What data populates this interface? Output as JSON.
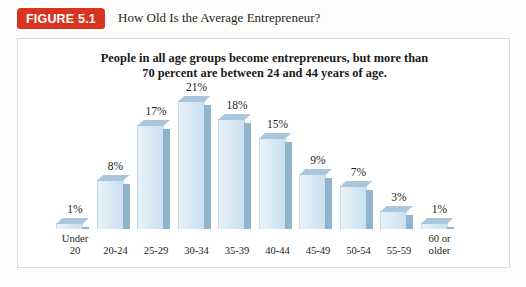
{
  "header": {
    "badge_label": "FIGURE 5.1",
    "title": "How Old Is the Average Entrepreneur?",
    "badge_color": "#d8341f"
  },
  "chart_data": {
    "type": "bar",
    "title": "How Old Is the Average Entrepreneur?",
    "subtitle_line1": "People in all age groups become entrepreneurs, but more than",
    "subtitle_line2": "70 percent are between 24 and 44 years of age.",
    "xlabel": "",
    "ylabel": "",
    "ylim": [
      0,
      21
    ],
    "grid": false,
    "legend": "none",
    "value_suffix": "%",
    "bar_face_color": "#d6e8f3",
    "bar_side_color": "#8fb4cc",
    "bar_top_color": "#a9c6da",
    "categories": [
      "Under 20",
      "20-24",
      "25-29",
      "30-34",
      "35-39",
      "40-44",
      "45-49",
      "50-54",
      "55-59",
      "60 or older"
    ],
    "category_lines": [
      [
        "Under",
        "20"
      ],
      [
        "20-24",
        ""
      ],
      [
        "25-29",
        ""
      ],
      [
        "30-34",
        ""
      ],
      [
        "35-39",
        ""
      ],
      [
        "40-44",
        ""
      ],
      [
        "45-49",
        ""
      ],
      [
        "50-54",
        ""
      ],
      [
        "55-59",
        ""
      ],
      [
        "60 or",
        "older"
      ]
    ],
    "values": [
      1,
      8,
      17,
      21,
      18,
      15,
      9,
      7,
      3,
      1
    ],
    "value_labels": [
      "1%",
      "8%",
      "17%",
      "21%",
      "18%",
      "15%",
      "9%",
      "7%",
      "3%",
      "1%"
    ]
  }
}
